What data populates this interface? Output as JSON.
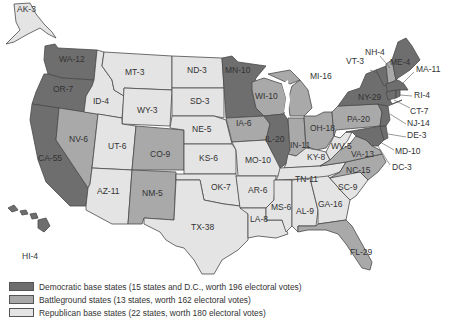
{
  "colors": {
    "democratic": "#6e6e6e",
    "battleground": "#a9a9a9",
    "republican": "#e4e4e4",
    "border": "#4a4a4a"
  },
  "states": {
    "AK": {
      "label": "AK-3",
      "category": "republican"
    },
    "HI": {
      "label": "HI-4",
      "category": "democratic"
    },
    "WA": {
      "label": "WA-12",
      "category": "democratic"
    },
    "OR": {
      "label": "OR-7",
      "category": "democratic"
    },
    "CA": {
      "label": "CA-55",
      "category": "democratic"
    },
    "NV": {
      "label": "NV-6",
      "category": "battleground"
    },
    "ID": {
      "label": "ID-4",
      "category": "republican"
    },
    "MT": {
      "label": "MT-3",
      "category": "republican"
    },
    "WY": {
      "label": "WY-3",
      "category": "republican"
    },
    "UT": {
      "label": "UT-6",
      "category": "republican"
    },
    "AZ": {
      "label": "AZ-11",
      "category": "republican"
    },
    "CO": {
      "label": "CO-9",
      "category": "battleground"
    },
    "NM": {
      "label": "NM-5",
      "category": "battleground"
    },
    "ND": {
      "label": "ND-3",
      "category": "republican"
    },
    "SD": {
      "label": "SD-3",
      "category": "republican"
    },
    "NE": {
      "label": "NE-5",
      "category": "republican"
    },
    "KS": {
      "label": "KS-6",
      "category": "republican"
    },
    "OK": {
      "label": "OK-7",
      "category": "republican"
    },
    "TX": {
      "label": "TX-38",
      "category": "republican"
    },
    "MN": {
      "label": "MN-10",
      "category": "democratic"
    },
    "IA": {
      "label": "IA-6",
      "category": "battleground"
    },
    "MO": {
      "label": "MO-10",
      "category": "republican"
    },
    "AR": {
      "label": "AR-6",
      "category": "republican"
    },
    "LA": {
      "label": "LA-8",
      "category": "republican"
    },
    "WI": {
      "label": "WI-10",
      "category": "battleground"
    },
    "IL": {
      "label": "IL-20",
      "category": "democratic"
    },
    "MI": {
      "label": "MI-16",
      "category": "battleground"
    },
    "IN": {
      "label": "IN-11",
      "category": "battleground"
    },
    "OH": {
      "label": "OH-18",
      "category": "battleground"
    },
    "KY": {
      "label": "KY-8",
      "category": "republican"
    },
    "TN": {
      "label": "TN-11",
      "category": "republican"
    },
    "MS": {
      "label": "MS-6",
      "category": "republican"
    },
    "AL": {
      "label": "AL-9",
      "category": "republican"
    },
    "GA": {
      "label": "GA-16",
      "category": "republican"
    },
    "FL": {
      "label": "FL-29",
      "category": "battleground"
    },
    "SC": {
      "label": "SC-9",
      "category": "republican"
    },
    "NC": {
      "label": "NC-15",
      "category": "battleground"
    },
    "VA": {
      "label": "VA-13",
      "category": "battleground"
    },
    "WV": {
      "label": "WV-5",
      "category": "republican"
    },
    "PA": {
      "label": "PA-20",
      "category": "battleground"
    },
    "NY": {
      "label": "NY-29",
      "category": "democratic"
    },
    "VT": {
      "label": "VT-3",
      "category": "democratic"
    },
    "NH": {
      "label": "NH-4",
      "category": "battleground"
    },
    "ME": {
      "label": "ME-4",
      "category": "democratic"
    },
    "MA": {
      "label": "MA-11",
      "category": "democratic"
    },
    "RI": {
      "label": "RI-4",
      "category": "democratic"
    },
    "CT": {
      "label": "CT-7",
      "category": "democratic"
    },
    "NJ": {
      "label": "NJ-14",
      "category": "democratic"
    },
    "DE": {
      "label": "DE-3",
      "category": "democratic"
    },
    "MD": {
      "label": "MD-10",
      "category": "democratic"
    },
    "DC": {
      "label": "DC-3",
      "category": "democratic"
    }
  },
  "legend": [
    {
      "category": "democratic",
      "label": "Democratic base states (15 states and D.C., worth 196 electoral votes)"
    },
    {
      "category": "battleground",
      "label": "Battleground states (13 states, worth 162 electoral votes)"
    },
    {
      "category": "republican",
      "label": "Republican base states (22 states, worth 180 electoral votes)"
    }
  ]
}
